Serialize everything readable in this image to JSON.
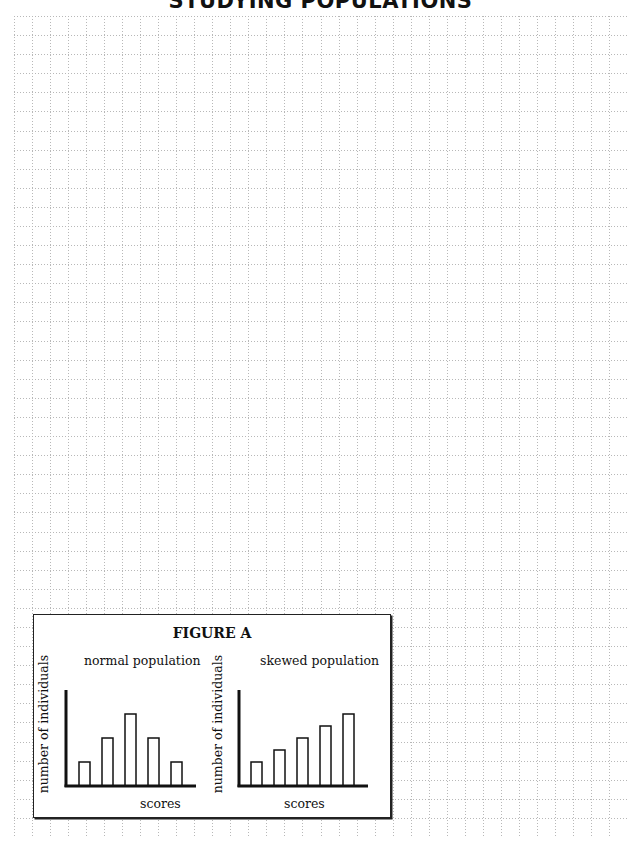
{
  "page": {
    "title": "STUDYING POPULATIONS"
  },
  "grid": {
    "columns": 34,
    "rows": 43,
    "line_color": "#b8b8b8"
  },
  "figure": {
    "title": "FIGURE A"
  },
  "chart_data": [
    {
      "type": "bar",
      "title": "normal population",
      "xlabel": "scores",
      "ylabel": "number of individuals",
      "categories": [
        "1",
        "2",
        "3",
        "4",
        "5"
      ],
      "values": [
        1,
        2,
        3,
        2,
        1
      ],
      "ylim": [
        0,
        4
      ],
      "grid": false,
      "legend": "none"
    },
    {
      "type": "bar",
      "title": "skewed population",
      "xlabel": "scores",
      "ylabel": "number of individuals",
      "categories": [
        "1",
        "2",
        "3",
        "4",
        "5"
      ],
      "values": [
        1,
        1.5,
        2,
        2.5,
        3
      ],
      "ylim": [
        0,
        4
      ],
      "grid": false,
      "legend": "none"
    }
  ]
}
